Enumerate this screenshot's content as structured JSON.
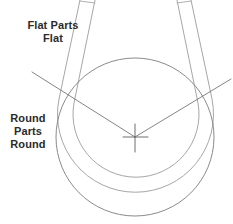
{
  "diagram": {
    "background_color": "#ffffff",
    "line_color": "#9a9a9a",
    "line_color_dark": "#6e6e6e",
    "text_color": "#2b2b2b",
    "labels": {
      "flat": {
        "name": "flat-parts-label",
        "lines": [
          "Flat Parts",
          "Flat"
        ]
      },
      "round": {
        "name": "round-parts-label",
        "lines": [
          "Round",
          "Parts",
          "Round"
        ]
      }
    },
    "geometry": {
      "center": {
        "x": 135,
        "y": 137
      },
      "inner_circle_radius": 79,
      "outer_arc_radius": 86,
      "mid_arc_radius": 79,
      "arm_left_top_x": 88,
      "arm_right_top_x": 160,
      "angle_line_left_end": {
        "x": 4,
        "y": 80
      },
      "angle_line_right_end": {
        "x": 230,
        "y": 83
      },
      "crosshair_size": 22
    }
  }
}
